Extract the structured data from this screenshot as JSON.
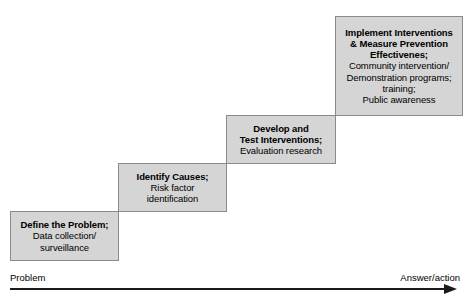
{
  "diagram": {
    "steps": [
      {
        "id": "define-the-problem",
        "heading": "Define the Problem;",
        "body_lines": [
          "Data collection/",
          "surveillance"
        ]
      },
      {
        "id": "identify-causes",
        "heading": "Identify Causes;",
        "body_lines": [
          "Risk factor",
          "identification"
        ]
      },
      {
        "id": "develop-and-test-interventions",
        "heading_lines": [
          "Develop and",
          "Test Interventions;"
        ],
        "body_lines": [
          "Evaluation research"
        ]
      },
      {
        "id": "implement-interventions",
        "heading_lines": [
          "Implement Interventions",
          "& Measure Prevention",
          "Effectivenes;"
        ],
        "body_lines": [
          "Community intervention/",
          "Demonstration programs;",
          "training;",
          "Public awareness"
        ]
      }
    ],
    "axis": {
      "left_label": "Problem",
      "right_label": "Answer/action",
      "arrow_direction": "right"
    },
    "colors": {
      "box_fill": "#d5d5d5",
      "box_border": "#8a8a8a",
      "axis": "#1b1b1b",
      "text": "#000000",
      "background": "#ffffff"
    }
  }
}
